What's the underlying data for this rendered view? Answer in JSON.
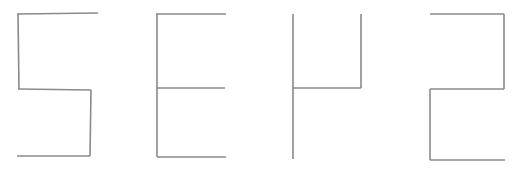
{
  "canvas": {
    "width": 519,
    "height": 176,
    "background_color": "#ffffff",
    "rendered_text": "SEP2",
    "description": "Four blocky stick-drawn glyphs spelling SEP2 in thin gray straight-line strokes on a white background"
  },
  "style": {
    "stroke_color": "#8a8a8a",
    "stroke_color_dark": "#6f6f6f",
    "stroke_width": 1.6,
    "stroke_linecap": "butt",
    "stroke_linejoin": "miter"
  },
  "glyphs": [
    {
      "character": "S",
      "index": 0,
      "name": "glyph-s",
      "bbox": {
        "x": 17,
        "y": 13,
        "width": 82,
        "height": 144
      },
      "strokes": [
        {
          "name": "s-top-bar",
          "points": "17,14 98,13"
        },
        {
          "name": "s-upper-left-stem",
          "points": "18,14 19,89"
        },
        {
          "name": "s-middle-bar",
          "points": "18,89 91,90"
        },
        {
          "name": "s-lower-right-stem",
          "points": "91,90 90,156"
        },
        {
          "name": "s-bottom-bar",
          "points": "17,156 90,156"
        }
      ]
    },
    {
      "character": "E",
      "index": 1,
      "name": "glyph-e",
      "bbox": {
        "x": 156,
        "y": 14,
        "width": 70,
        "height": 143
      },
      "strokes": [
        {
          "name": "e-top-bar",
          "points": "156,14 226,14"
        },
        {
          "name": "e-vertical-stem",
          "points": "157,14 157,157"
        },
        {
          "name": "e-middle-bar",
          "points": "156,88 225,88"
        },
        {
          "name": "e-bottom-bar",
          "points": "157,157 226,157"
        }
      ]
    },
    {
      "character": "P",
      "index": 2,
      "name": "glyph-p",
      "bbox": {
        "x": 292,
        "y": 14,
        "width": 70,
        "height": 145
      },
      "strokes": [
        {
          "name": "p-left-stem",
          "points": "293,14 293,159"
        },
        {
          "name": "p-bowl-right-stem",
          "points": "361,14 361,88"
        },
        {
          "name": "p-bowl-bottom-bar",
          "points": "292,88 361,88"
        }
      ]
    },
    {
      "character": "2",
      "index": 3,
      "name": "glyph-2",
      "bbox": {
        "x": 430,
        "y": 14,
        "width": 75,
        "height": 146
      },
      "strokes": [
        {
          "name": "two-top-bar",
          "points": "430,14 504,14"
        },
        {
          "name": "two-upper-right-stem",
          "points": "504,14 504,89"
        },
        {
          "name": "two-middle-bar",
          "points": "430,89 504,89"
        },
        {
          "name": "two-lower-left-stem",
          "points": "430,89 430,160"
        },
        {
          "name": "two-bottom-bar",
          "points": "430,160 505,160"
        }
      ]
    }
  ]
}
